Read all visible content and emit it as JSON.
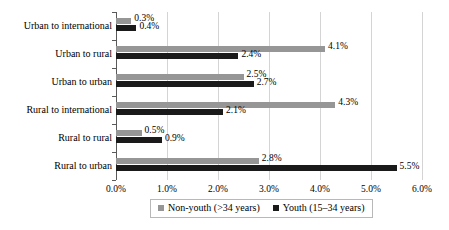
{
  "chart_data": {
    "type": "bar",
    "orientation": "horizontal",
    "title": "",
    "xlabel": "",
    "ylabel": "",
    "xlim": [
      0,
      6
    ],
    "x_tick_labels": [
      "0.0%",
      "1.0%",
      "2.0%",
      "3.0%",
      "4.0%",
      "5.0%",
      "6.0%"
    ],
    "x_tick_values": [
      0,
      1,
      2,
      3,
      4,
      5,
      6
    ],
    "grid": true,
    "legend_position": "bottom",
    "categories": [
      "Urban to international",
      "Urban to rural",
      "Urban to urban",
      "Rural to international",
      "Rural to rural",
      "Rural to urban"
    ],
    "series": [
      {
        "name": "Non-youth (>34 years)",
        "color": "#969696",
        "values": [
          0.3,
          4.1,
          2.5,
          4.3,
          0.5,
          2.8
        ],
        "labels": [
          "0.3%",
          "4.1%",
          "2.5%",
          "4.3%",
          "0.5%",
          "2.8%"
        ]
      },
      {
        "name": "Youth (15–34 years)",
        "color": "#1a1a1a",
        "values": [
          0.4,
          2.4,
          2.7,
          2.1,
          0.9,
          5.5
        ],
        "labels": [
          "0.4%",
          "2.4%",
          "2.7%",
          "2.1%",
          "0.9%",
          "5.5%"
        ]
      }
    ]
  },
  "legend": {
    "items": [
      {
        "label": "Non-youth (>34 years)",
        "swatch": "nonyouth"
      },
      {
        "label": "Youth (15–34 years)",
        "swatch": "youth"
      }
    ]
  }
}
